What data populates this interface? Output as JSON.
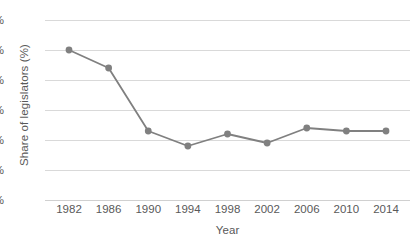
{
  "chart_data": {
    "type": "line",
    "title": "",
    "xlabel": "Year",
    "ylabel": "Share of legislators (%)",
    "categories": [
      "1982",
      "1986",
      "1990",
      "1994",
      "1998",
      "2002",
      "2006",
      "2010",
      "2014"
    ],
    "x": [
      1982,
      1986,
      1990,
      1994,
      1998,
      2002,
      2006,
      2010,
      2014
    ],
    "values": [
      50,
      44,
      23,
      18,
      22,
      19,
      24,
      23,
      23
    ],
    "series": [
      {
        "name": "Share of legislators (%)",
        "values": [
          50,
          44,
          23,
          18,
          22,
          19,
          24,
          23,
          23
        ]
      }
    ],
    "ytick_labels": [
      "0%",
      "10%",
      "20%",
      "30%",
      "40%",
      "50%",
      "60%"
    ],
    "ytick_values": [
      0,
      10,
      20,
      30,
      40,
      50,
      60
    ],
    "ylim": [
      0,
      60
    ],
    "xlim": [
      1982,
      2014
    ],
    "grid": "horizontal",
    "legend": "none",
    "marker": "circle",
    "colors": {
      "line": "#808080",
      "marker": "#808080",
      "gridline": "#d9d9d9",
      "axis": "#d0d0d0",
      "text": "#595959",
      "background": "#ffffff"
    }
  }
}
